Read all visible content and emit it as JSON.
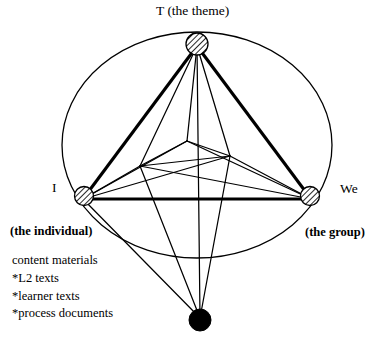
{
  "diagram": {
    "vertices": [
      {
        "id": "theme",
        "key": "T",
        "label": "T (the theme)",
        "marker": "hatched-circle",
        "position": "top"
      },
      {
        "id": "individual",
        "key": "I",
        "label": "I",
        "sublabel": "(the individual)",
        "marker": "hatched-circle",
        "position": "left"
      },
      {
        "id": "group",
        "key": "We",
        "label": "We",
        "sublabel": "(the group)",
        "marker": "hatched-circle",
        "position": "right"
      },
      {
        "id": "materials-node",
        "key": "",
        "label": "",
        "marker": "filled-circle",
        "position": "bottom"
      }
    ],
    "materials": {
      "heading": "content materials",
      "items": [
        "*L2 texts",
        "*learner texts",
        "*process documents"
      ]
    },
    "colors": {
      "stroke": "#000000",
      "fill_node": "#000000",
      "background": "#ffffff",
      "hatch": "#000000"
    },
    "shapes": {
      "boundary": "ellipse",
      "outer_triangle": "T-I-We",
      "inner_network": "crossing-lines"
    }
  }
}
